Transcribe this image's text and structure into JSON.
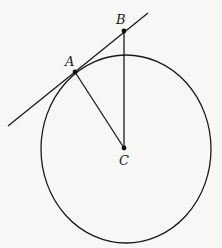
{
  "diagram": {
    "type": "geometry",
    "stroke_color": "#1a1a1a",
    "background_color": "#f7f7f5",
    "points": {
      "A": {
        "label": "A",
        "x": 75,
        "y": 72
      },
      "B": {
        "label": "B",
        "x": 124,
        "y": 31
      },
      "C": {
        "label": "C",
        "x": 124,
        "y": 148
      }
    },
    "circle": {
      "center": "C",
      "cx": 126,
      "cy": 149,
      "rx": 85,
      "ry": 94
    },
    "tangent_line": {
      "x1": 8,
      "y1": 126,
      "x2": 148,
      "y2": 13
    },
    "segments": [
      {
        "from": "A",
        "to": "C"
      },
      {
        "from": "B",
        "to": "C"
      }
    ]
  }
}
